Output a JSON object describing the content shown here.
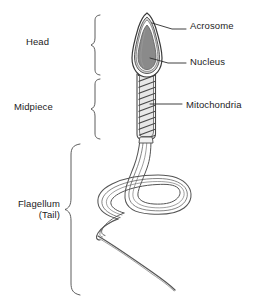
{
  "diagram": {
    "background_color": "#ffffff",
    "stroke_color": "#3a3a3a",
    "nucleus_color": "#8a8a8a",
    "acrosome_color": "#c9c9c9",
    "membrane_color": "#ffffff"
  },
  "labels": {
    "left": [
      {
        "id": "head",
        "text": "Head"
      },
      {
        "id": "midpiece",
        "text": "Midpiece"
      },
      {
        "id": "flagellum_line1",
        "text": "Flagellum"
      },
      {
        "id": "flagellum_line2",
        "text": "(Tail)"
      }
    ],
    "right": [
      {
        "id": "acrosome",
        "text": "Acrosome"
      },
      {
        "id": "nucleus",
        "text": "Nucleus"
      },
      {
        "id": "mitochondria",
        "text": "Mitochondria"
      }
    ]
  },
  "regions": [
    {
      "name": "Head",
      "brace_top": 14,
      "brace_bottom": 76
    },
    {
      "name": "Midpiece",
      "brace_top": 78,
      "brace_bottom": 140
    },
    {
      "name": "Flagellum (Tail)",
      "brace_top": 143,
      "brace_bottom": 296
    }
  ],
  "callouts": [
    {
      "name": "Acrosome",
      "points_to": "acrosome cap at head apex"
    },
    {
      "name": "Nucleus",
      "points_to": "gray nucleus inside head"
    },
    {
      "name": "Mitochondria",
      "points_to": "helical sheath in midpiece"
    }
  ]
}
